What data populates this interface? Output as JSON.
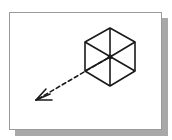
{
  "figure": {
    "frame": {
      "background": "#ffffff",
      "border_color": "#9a9a9a",
      "shadow_color": "#a8a8a8"
    },
    "hexagon": {
      "center": [
        110,
        57
      ],
      "vertices": [
        [
          110,
          28
        ],
        [
          135,
          42
        ],
        [
          135,
          71
        ],
        [
          110,
          86
        ],
        [
          85,
          71
        ],
        [
          85,
          42
        ]
      ],
      "stroke_color": "#1a1a1a"
    },
    "arrow": {
      "from": [
        110,
        57
      ],
      "to": [
        36,
        100
      ],
      "style": "dashed",
      "stroke_color": "#1a1a1a"
    }
  }
}
